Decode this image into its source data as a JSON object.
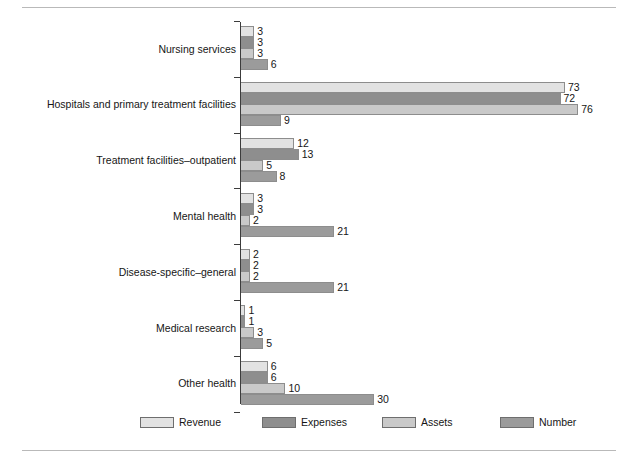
{
  "chart_data": {
    "type": "bar",
    "orientation": "horizontal",
    "title": "",
    "xlabel": "",
    "ylabel": "",
    "grid": false,
    "legend_position": "bottom",
    "xlim": [
      0,
      80
    ],
    "categories": [
      "Nursing services",
      "Hospitals and primary treatment facilities",
      "Treatment facilities–outpatient",
      "Mental health",
      "Disease-specific–general",
      "Medical research",
      "Other health"
    ],
    "series": [
      {
        "name": "Revenue",
        "color": "#e2e2e2",
        "values": [
          3,
          73,
          12,
          3,
          2,
          1,
          6
        ]
      },
      {
        "name": "Expenses",
        "color": "#8e8e8e",
        "values": [
          3,
          72,
          13,
          3,
          2,
          1,
          6
        ]
      },
      {
        "name": "Assets",
        "color": "#c9c9c9",
        "values": [
          3,
          76,
          5,
          2,
          2,
          3,
          10
        ]
      },
      {
        "name": "Number",
        "color": "#9b9b9b",
        "values": [
          6,
          9,
          8,
          21,
          21,
          5,
          30
        ]
      }
    ],
    "value_labels": [
      [
        "3",
        "3",
        "3",
        "6"
      ],
      [
        "73",
        "72",
        "76",
        "9"
      ],
      [
        "12",
        "13",
        "5",
        "8"
      ],
      [
        "3",
        "3",
        "2",
        "21"
      ],
      [
        "2",
        "2",
        "2",
        "21"
      ],
      [
        "1",
        "1",
        "3",
        "5"
      ],
      [
        "6",
        "6",
        "10",
        "30"
      ]
    ]
  },
  "legend": {
    "items": [
      {
        "label": "Revenue"
      },
      {
        "label": "Expenses"
      },
      {
        "label": "Assets"
      },
      {
        "label": "Number"
      }
    ]
  },
  "caption": ""
}
